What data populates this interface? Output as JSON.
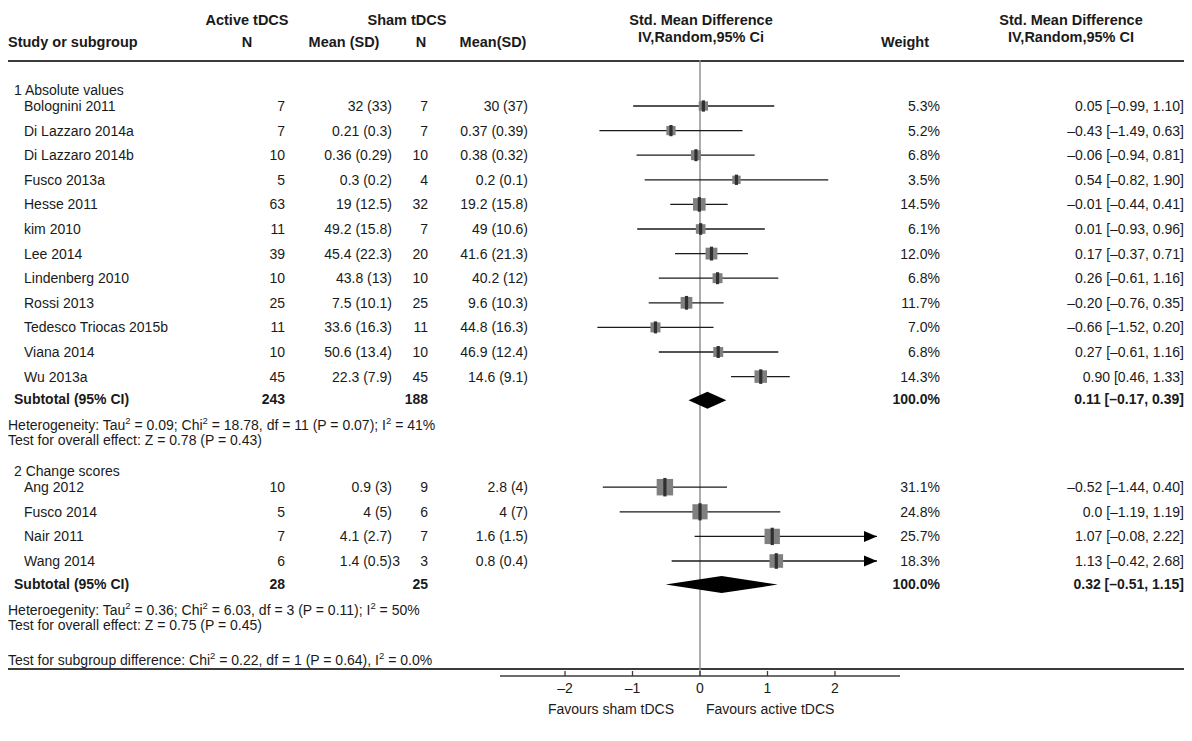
{
  "header": {
    "group_active": "Active tDCS",
    "group_sham": "Sham tDCS",
    "col_study": "Study or subgroup",
    "col_n1": "N",
    "col_mean1": "Mean (SD)",
    "col_n2": "N",
    "col_mean2": "Mean(SD)",
    "col_plot_line1": "Std. Mean Difference",
    "col_plot_line2": "IV,Random,95% Ci",
    "col_weight": "Weight",
    "col_effect_line1": "Std. Mean Difference",
    "col_effect_line2": "IV,Random,95% CI"
  },
  "subgroups": [
    {
      "title": "1 Absolute values",
      "rows": [
        {
          "study": "Bolognini 2011",
          "n1": "7",
          "mean1": "32 (33)",
          "n2": "7",
          "mean2": "30 (37)",
          "weight": "5.3%",
          "effect": "0.05 [–0.99, 1.10]",
          "est": 0.05,
          "lo": -0.99,
          "hi": 1.1,
          "box": 5.3
        },
        {
          "study": "Di Lazzaro 2014a",
          "n1": "7",
          "mean1": "0.21 (0.3)",
          "n2": "7",
          "mean2": "0.37 (0.39)",
          "weight": "5.2%",
          "effect": "–0.43 [–1.49, 0.63]",
          "est": -0.43,
          "lo": -1.49,
          "hi": 0.63,
          "box": 5.2
        },
        {
          "study": "Di Lazzaro 2014b",
          "n1": "10",
          "mean1": "0.36 (0.29)",
          "n2": "10",
          "mean2": "0.38 (0.32)",
          "weight": "6.8%",
          "effect": "–0.06 [–0.94, 0.81]",
          "est": -0.06,
          "lo": -0.94,
          "hi": 0.81,
          "box": 6.8
        },
        {
          "study": "Fusco 2013a",
          "n1": "5",
          "mean1": "0.3 (0.2)",
          "n2": "4",
          "mean2": "0.2 (0.1)",
          "weight": "3.5%",
          "effect": "0.54 [–0.82, 1.90]",
          "est": 0.54,
          "lo": -0.82,
          "hi": 1.9,
          "box": 3.5
        },
        {
          "study": "Hesse 2011",
          "n1": "63",
          "mean1": "19 (12.5)",
          "n2": "32",
          "mean2": "19.2 (15.8)",
          "weight": "14.5%",
          "effect": "–0.01 [–0.44, 0.41]",
          "est": -0.01,
          "lo": -0.44,
          "hi": 0.41,
          "box": 14.5
        },
        {
          "study": "kim 2010",
          "n1": "11",
          "mean1": "49.2 (15.8)",
          "n2": "7",
          "mean2": "49 (10.6)",
          "weight": "6.1%",
          "effect": "0.01 [–0.93, 0.96]",
          "est": 0.01,
          "lo": -0.93,
          "hi": 0.96,
          "box": 6.1
        },
        {
          "study": "Lee 2014",
          "n1": "39",
          "mean1": "45.4 (22.3)",
          "n2": "20",
          "mean2": "41.6 (21.3)",
          "weight": "12.0%",
          "effect": "0.17 [–0.37, 0.71]",
          "est": 0.17,
          "lo": -0.37,
          "hi": 0.71,
          "box": 12.0
        },
        {
          "study": "Lindenberg 2010",
          "n1": "10",
          "mean1": "43.8 (13)",
          "n2": "10",
          "mean2": "40.2 (12)",
          "weight": "6.8%",
          "effect": "0.26 [–0.61, 1.16]",
          "est": 0.26,
          "lo": -0.61,
          "hi": 1.16,
          "box": 6.8
        },
        {
          "study": "Rossi 2013",
          "n1": "25",
          "mean1": "7.5 (10.1)",
          "n2": "25",
          "mean2": "9.6 (10.3)",
          "weight": "11.7%",
          "effect": "–0.20 [–0.76, 0.35]",
          "est": -0.2,
          "lo": -0.76,
          "hi": 0.35,
          "box": 11.7
        },
        {
          "study": "Tedesco Triocas 2015b",
          "n1": "11",
          "mean1": "33.6 (16.3)",
          "n2": "11",
          "mean2": "44.8 (16.3)",
          "weight": "7.0%",
          "effect": "–0.66 [–1.52, 0.20]",
          "est": -0.66,
          "lo": -1.52,
          "hi": 0.2,
          "box": 7.0
        },
        {
          "study": "Viana 2014",
          "n1": "10",
          "mean1": "50.6 (13.4)",
          "n2": "10",
          "mean2": "46.9 (12.4)",
          "weight": "6.8%",
          "effect": "0.27 [–0.61, 1.16]",
          "est": 0.27,
          "lo": -0.61,
          "hi": 1.16,
          "box": 6.8
        },
        {
          "study": "Wu 2013a",
          "n1": "45",
          "mean1": "22.3 (7.9)",
          "n2": "45",
          "mean2": "14.6 (9.1)",
          "weight": "14.3%",
          "effect": "0.90 [0.46, 1.33]",
          "est": 0.9,
          "lo": 0.46,
          "hi": 1.33,
          "box": 14.3
        }
      ],
      "subtotal": {
        "label": "Subtotal (95% CI)",
        "n1": "243",
        "n2": "188",
        "weight": "100.0%",
        "effect": "0.11 [–0.17, 0.39]",
        "est": 0.11,
        "lo": -0.17,
        "hi": 0.39
      },
      "heterogeneity": {
        "prefix": "Heterogeneity: Tau",
        "sup1": "2",
        "mid1": " = 0.09; Chi",
        "sup2": "2",
        "mid2": " = 18.78, df = 11 (P = 0.07); I",
        "sup3": "2",
        "suffix": " = 41%"
      },
      "overall_effect": "Test for overall effect: Z = 0.78 (P = 0.43)"
    },
    {
      "title": "2 Change scores",
      "rows": [
        {
          "study": "Ang 2012",
          "n1": "10",
          "mean1": "0.9 (3)",
          "n2": "9",
          "mean2": "2.8 (4)",
          "weight": "31.1%",
          "effect": "–0.52 [–1.44, 0.40]",
          "est": -0.52,
          "lo": -1.44,
          "hi": 0.4,
          "box": 31.1,
          "arrow": false
        },
        {
          "study": "Fusco 2014",
          "n1": "5",
          "mean1": "4 (5)",
          "n2": "6",
          "mean2": "4 (7)",
          "weight": "24.8%",
          "effect": "0.0 [–1.19, 1.19]",
          "est": 0.0,
          "lo": -1.19,
          "hi": 1.19,
          "box": 24.8,
          "arrow": false
        },
        {
          "study": "Nair 2011",
          "n1": "7",
          "mean1": "4.1 (2.7)",
          "n2": "7",
          "mean2": "1.6 (1.5)",
          "weight": "25.7%",
          "effect": "1.07 [–0.08, 2.22]",
          "est": 1.07,
          "lo": -0.08,
          "hi": 2.22,
          "box": 25.7,
          "arrow": true
        },
        {
          "study": "Wang 2014",
          "n1": "6",
          "mean1": "1.4 (0.5)",
          "n2": "3",
          "n2extra": "3",
          "mean2": "0.8 (0.4)",
          "weight": "18.3%",
          "effect": "1.13 [–0.42, 2.68]",
          "est": 1.13,
          "lo": -0.42,
          "hi": 2.68,
          "box": 18.3,
          "arrow": true
        }
      ],
      "subtotal": {
        "label": "Subtotal (95% CI)",
        "n1": "28",
        "n2": "25",
        "weight": "100.0%",
        "effect": "0.32 [–0.51, 1.15]",
        "est": 0.32,
        "lo": -0.51,
        "hi": 1.15
      },
      "heterogeneity": {
        "prefix": "Heteroegenity: Tau",
        "sup1": "2",
        "mid1": " = 0.36; Chi",
        "sup2": "2",
        "mid2": " = 6.03, df = 3 (P = 0.11); I",
        "sup3": "2",
        "suffix": " = 50%"
      },
      "overall_effect": "Test for overall effect: Z = 0.75 (P = 0.45)"
    }
  ],
  "subgroup_difference": {
    "prefix": "Test for subgroup difference: Chi",
    "sup1": "2",
    "mid1": " = 0.22, df = 1 (P = 0.64), I",
    "sup2": "2",
    "suffix": " = 0.0%"
  },
  "axis": {
    "ticks": [
      "–2",
      "–1",
      "0",
      "1",
      "2"
    ],
    "tick_values": [
      -2,
      -1,
      0,
      1,
      2
    ],
    "favours_left": "Favours sham tDCS",
    "favours_right": "Favours active tDCS",
    "min": -2.6,
    "max": 2.6,
    "zero": 0
  },
  "colors": {
    "text": "#1a1a1a",
    "rule": "#3c3c3c",
    "marker": "#808080",
    "marker_center": "#303030",
    "ci_line": "#1a1a1a",
    "diamond": "#000000",
    "zero_line": "#8a8a8a"
  },
  "chart_data": {
    "type": "forest",
    "title": "Std. Mean Difference IV,Random,95% CI",
    "xlabel": "Standardised Mean Difference",
    "xlim": [
      -2.6,
      2.6
    ],
    "xticks": [
      -2,
      -1,
      0,
      1,
      2
    ],
    "null_line": 0,
    "studies": [
      {
        "label": "Bolognini 2011",
        "subgroup": "1 Absolute values",
        "est": 0.05,
        "lo": -0.99,
        "hi": 1.1,
        "weight": 5.3
      },
      {
        "label": "Di Lazzaro 2014a",
        "subgroup": "1 Absolute values",
        "est": -0.43,
        "lo": -1.49,
        "hi": 0.63,
        "weight": 5.2
      },
      {
        "label": "Di Lazzaro 2014b",
        "subgroup": "1 Absolute values",
        "est": -0.06,
        "lo": -0.94,
        "hi": 0.81,
        "weight": 6.8
      },
      {
        "label": "Fusco 2013a",
        "subgroup": "1 Absolute values",
        "est": 0.54,
        "lo": -0.82,
        "hi": 1.9,
        "weight": 3.5
      },
      {
        "label": "Hesse 2011",
        "subgroup": "1 Absolute values",
        "est": -0.01,
        "lo": -0.44,
        "hi": 0.41,
        "weight": 14.5
      },
      {
        "label": "kim 2010",
        "subgroup": "1 Absolute values",
        "est": 0.01,
        "lo": -0.93,
        "hi": 0.96,
        "weight": 6.1
      },
      {
        "label": "Lee 2014",
        "subgroup": "1 Absolute values",
        "est": 0.17,
        "lo": -0.37,
        "hi": 0.71,
        "weight": 12.0
      },
      {
        "label": "Lindenberg 2010",
        "subgroup": "1 Absolute values",
        "est": 0.26,
        "lo": -0.61,
        "hi": 1.16,
        "weight": 6.8
      },
      {
        "label": "Rossi 2013",
        "subgroup": "1 Absolute values",
        "est": -0.2,
        "lo": -0.76,
        "hi": 0.35,
        "weight": 11.7
      },
      {
        "label": "Tedesco Triocas 2015b",
        "subgroup": "1 Absolute values",
        "est": -0.66,
        "lo": -1.52,
        "hi": 0.2,
        "weight": 7.0
      },
      {
        "label": "Viana 2014",
        "subgroup": "1 Absolute values",
        "est": 0.27,
        "lo": -0.61,
        "hi": 1.16,
        "weight": 6.8
      },
      {
        "label": "Wu 2013a",
        "subgroup": "1 Absolute values",
        "est": 0.9,
        "lo": 0.46,
        "hi": 1.33,
        "weight": 14.3
      },
      {
        "label": "Ang 2012",
        "subgroup": "2 Change scores",
        "est": -0.52,
        "lo": -1.44,
        "hi": 0.4,
        "weight": 31.1
      },
      {
        "label": "Fusco 2014",
        "subgroup": "2 Change scores",
        "est": 0.0,
        "lo": -1.19,
        "hi": 1.19,
        "weight": 24.8
      },
      {
        "label": "Nair 2011",
        "subgroup": "2 Change scores",
        "est": 1.07,
        "lo": -0.08,
        "hi": 2.22,
        "weight": 25.7
      },
      {
        "label": "Wang 2014",
        "subgroup": "2 Change scores",
        "est": 1.13,
        "lo": -0.42,
        "hi": 2.68,
        "weight": 18.3
      }
    ],
    "pooled": [
      {
        "label": "Subtotal (95% CI) — 1 Absolute values",
        "est": 0.11,
        "lo": -0.17,
        "hi": 0.39
      },
      {
        "label": "Subtotal (95% CI) — 2 Change scores",
        "est": 0.32,
        "lo": -0.51,
        "hi": 1.15
      }
    ]
  }
}
